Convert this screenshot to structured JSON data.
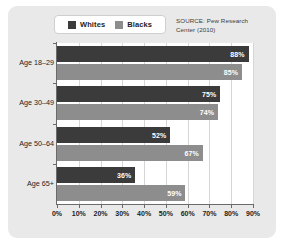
{
  "chart_data": {
    "type": "bar",
    "orientation": "horizontal",
    "title": "",
    "xlabel": "",
    "ylabel": "",
    "categories": [
      "Age 18–29",
      "Age 30–49",
      "Age 50–64",
      "Age 65+"
    ],
    "series": [
      {
        "name": "Whites",
        "color": "#3b3b3b",
        "values": [
          88,
          75,
          52,
          36
        ],
        "value_labels": [
          "88%",
          "75%",
          "52%",
          "36%"
        ]
      },
      {
        "name": "Blacks",
        "color": "#8d8d8d",
        "values": [
          85,
          74,
          67,
          59
        ],
        "value_labels": [
          "85%",
          "74%",
          "67%",
          "59%"
        ]
      }
    ],
    "xlim": [
      0,
      90
    ],
    "xticks": [
      0,
      10,
      20,
      30,
      40,
      50,
      60,
      70,
      80,
      90
    ],
    "xtick_labels": [
      "0%",
      "10%",
      "20%",
      "30%",
      "40%",
      "50%",
      "60%",
      "70%",
      "80%",
      "90%"
    ],
    "grid": true,
    "grid_axis": "x",
    "legend": {
      "position": "top-left",
      "entries": [
        "Whites",
        "Blacks"
      ]
    },
    "annotations": [
      "SOURCE: Pew Research Center (2010)"
    ]
  },
  "legend": {
    "entries": [
      {
        "label": "Whites",
        "color": "#3b3b3b"
      },
      {
        "label": "Blacks",
        "color": "#8d8d8d"
      }
    ]
  },
  "source_note": {
    "line1": "SOURCE: Pew Research",
    "line2": "Center (2010)"
  },
  "colors": {
    "panel_background": "#e9e9e9",
    "plot_background": "#ffffff",
    "whites_bar": "#3b3b3b",
    "blacks_bar": "#8d8d8d",
    "gridline": "#d6d6d6",
    "axis": "#6a6a6a",
    "text": "#1d1d1d"
  }
}
